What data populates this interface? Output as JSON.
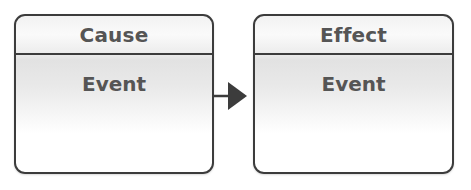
{
  "diagram": {
    "nodes": [
      {
        "id": "cause",
        "header": "Cause",
        "body": "Event"
      },
      {
        "id": "effect",
        "header": "Effect",
        "body": "Event"
      }
    ],
    "edges": [
      {
        "from": "cause",
        "to": "effect",
        "type": "arrow"
      }
    ],
    "colors": {
      "border": "#3c3c3c",
      "text": "#555555",
      "fill_top": "#f2f2f2",
      "fill_bottom": "#ffffff"
    }
  }
}
